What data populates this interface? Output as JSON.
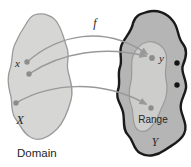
{
  "figure": {
    "type": "function-mapping-diagram",
    "function_label": "f",
    "domain": {
      "set_label": "X",
      "element_label": "x",
      "caption": "Domain",
      "point_count": 3
    },
    "codomain": {
      "set_label": "Y",
      "element_label": "y",
      "range_label": "Range",
      "range_point_count": 2,
      "points_outside_range_count": 2
    },
    "arrow_count": 3,
    "colors": {
      "background": "#ffffff",
      "domain_fill": "#d6d6d5",
      "domain_stroke": "#9a9a9a",
      "codomain_fill": "#b4b5b4",
      "codomain_stroke": "#1a1a1a",
      "range_fill": "#cdcdcc",
      "range_stroke": "#9a9a9a",
      "arrow": "#999999",
      "point": "#8d8d8d",
      "excluded_point": "#141414",
      "text": "#262626"
    }
  }
}
